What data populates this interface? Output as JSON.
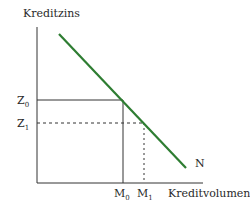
{
  "diagram": {
    "y_axis_label": "Kreditzins",
    "x_axis_label": "Kreditvolumen",
    "curve_label": "N",
    "curve_color": "#2e7d32",
    "y_ticks": [
      {
        "main": "Z",
        "sub": "0"
      },
      {
        "main": "Z",
        "sub": "1"
      }
    ],
    "x_ticks": [
      {
        "main": "M",
        "sub": "0"
      },
      {
        "main": "M",
        "sub": "1"
      }
    ]
  }
}
